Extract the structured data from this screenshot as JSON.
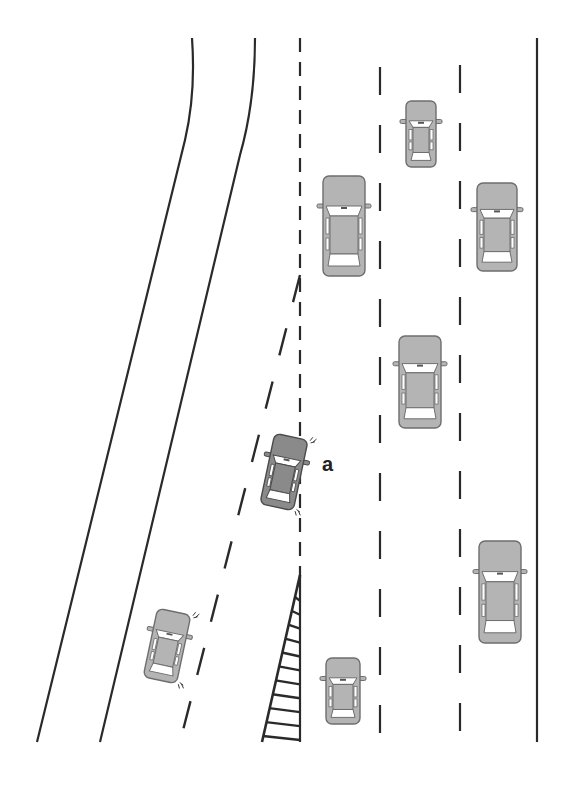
{
  "diagram": {
    "label": "a",
    "colors": {
      "background": "#ffffff",
      "line": "#2a2a2a",
      "car_body": "#b4b4b4",
      "car_body_highlight": "#8a8a8a",
      "car_outline": "#6e6e6e",
      "car_window": "#ffffff"
    },
    "road_lines": [
      {
        "id": "left-edge-outer",
        "type": "solid",
        "d": "M192,38 C195,80 192,110 185,140 L37,742"
      },
      {
        "id": "left-edge-inner",
        "type": "solid",
        "d": "M255,38 C255,80 250,120 240,155 L100,742"
      },
      {
        "id": "merge-lane-dashed",
        "type": "dashed-slanted",
        "x1": 300,
        "y1": 275,
        "x2": 180,
        "y2": 742,
        "dash": "28 27"
      },
      {
        "id": "center-dashed",
        "type": "dashed",
        "x1": 300,
        "y1": 38,
        "x2": 300,
        "y2": 578,
        "dash": "14 10"
      },
      {
        "id": "center-solid-gore",
        "type": "solid",
        "x1": 300,
        "y1": 575,
        "x2": 300,
        "y2": 742
      },
      {
        "id": "lane-dashed-1",
        "type": "dashed",
        "x1": 380,
        "y1": 67,
        "x2": 380,
        "y2": 742,
        "dash": "28 30"
      },
      {
        "id": "lane-dashed-2",
        "type": "dashed",
        "x1": 460,
        "y1": 65,
        "x2": 460,
        "y2": 742,
        "dash": "28 30"
      },
      {
        "id": "right-edge",
        "type": "solid",
        "x1": 537,
        "y1": 38,
        "x2": 537,
        "y2": 742
      }
    ],
    "gore": {
      "apex": [
        300,
        575
      ],
      "base_left": [
        262,
        742
      ],
      "base_right": [
        300,
        742
      ],
      "hatch_count": 12
    },
    "cars": [
      {
        "id": "car-top-middle",
        "cx": 421,
        "cy": 134,
        "w": 30,
        "h": 66,
        "rotate": 0,
        "highlight": false,
        "signals": false
      },
      {
        "id": "car-left-lane-upper",
        "cx": 344,
        "cy": 226,
        "w": 42,
        "h": 100,
        "rotate": 0,
        "highlight": false,
        "signals": false
      },
      {
        "id": "car-right-lane-upper",
        "cx": 497,
        "cy": 227,
        "w": 40,
        "h": 88,
        "rotate": 0,
        "highlight": false,
        "signals": false
      },
      {
        "id": "car-middle-lane",
        "cx": 420,
        "cy": 382,
        "w": 42,
        "h": 92,
        "rotate": 0,
        "highlight": false,
        "signals": false
      },
      {
        "id": "car-a-merging",
        "cx": 284,
        "cy": 472,
        "w": 34,
        "h": 72,
        "rotate": 12,
        "highlight": true,
        "signals": true
      },
      {
        "id": "car-right-lane-lower",
        "cx": 500,
        "cy": 592,
        "w": 42,
        "h": 102,
        "rotate": 0,
        "highlight": false,
        "signals": false
      },
      {
        "id": "car-merge-lane-lower",
        "cx": 167,
        "cy": 646,
        "w": 34,
        "h": 70,
        "rotate": 12,
        "highlight": false,
        "signals": true
      },
      {
        "id": "car-left-lane-lower",
        "cx": 343,
        "cy": 691,
        "w": 34,
        "h": 66,
        "rotate": 0,
        "highlight": false,
        "signals": false
      }
    ],
    "label_position": {
      "x": 322,
      "y": 471
    }
  }
}
